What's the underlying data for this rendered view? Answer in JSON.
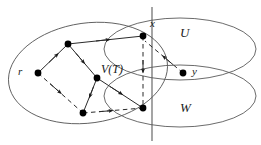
{
  "figure": {
    "type": "graph-diagram",
    "colors": {
      "stroke": "#5a5a5a",
      "edge": "#2b2b2b",
      "vertex_fill": "#000000",
      "text": "#1a1a1a",
      "background": "#ffffff"
    }
  },
  "labels": {
    "root": "r",
    "cut_vertex_top": "x",
    "right_vertex": "y",
    "region_upper": "U",
    "region_lower": "W",
    "tree_set": "V(T)"
  },
  "regions": [
    {
      "name": "vt-ellipse",
      "label": "V(T)",
      "cx": 88,
      "cy": 73,
      "rx": 80,
      "ry": 50,
      "rotate": -8
    },
    {
      "name": "u-ellipse",
      "label": "U",
      "cx": 178,
      "cy": 50,
      "rx": 78,
      "ry": 32,
      "rotate": 0
    },
    {
      "name": "w-ellipse",
      "label": "W",
      "cx": 178,
      "cy": 95,
      "rx": 78,
      "ry": 32,
      "rotate": 0
    }
  ],
  "cut_line": {
    "name": "cut-line",
    "x1": 152,
    "y1": 8,
    "x2": 152,
    "y2": 140
  },
  "vertices": [
    {
      "id": "r",
      "name": "vertex-r",
      "x": 38,
      "y": 73,
      "label": "r"
    },
    {
      "id": "a",
      "name": "vertex-a",
      "x": 68,
      "y": 44,
      "label": ""
    },
    {
      "id": "c",
      "name": "vertex-c",
      "x": 97,
      "y": 78,
      "label": ""
    },
    {
      "id": "d",
      "name": "vertex-d",
      "x": 83,
      "y": 113,
      "label": ""
    },
    {
      "id": "x",
      "name": "vertex-x",
      "x": 143,
      "y": 36,
      "label": "x"
    },
    {
      "id": "w1",
      "name": "vertex-w1",
      "x": 143,
      "y": 108,
      "label": ""
    },
    {
      "id": "y",
      "name": "vertex-y",
      "x": 183,
      "y": 73,
      "label": "y"
    }
  ],
  "edges": [
    {
      "name": "edge-r-a",
      "from": "r",
      "to": "a",
      "style": "solid",
      "arrow": "mid"
    },
    {
      "name": "edge-a-c",
      "from": "a",
      "to": "c",
      "style": "solid",
      "arrow": "mid"
    },
    {
      "name": "edge-a-x",
      "from": "a",
      "to": "x",
      "style": "solid",
      "arrow": "mid"
    },
    {
      "name": "edge-c-d",
      "from": "c",
      "to": "d",
      "style": "solid",
      "arrow": "mid"
    },
    {
      "name": "edge-c-w1",
      "from": "c",
      "to": "w1",
      "style": "solid",
      "arrow": "mid"
    },
    {
      "name": "edge-r-d",
      "from": "r",
      "to": "d",
      "style": "dashed",
      "arrow": "mid"
    },
    {
      "name": "edge-d-w1",
      "from": "d",
      "to": "w1",
      "style": "dashed",
      "arrow": "mid"
    },
    {
      "name": "edge-x-w1",
      "from": "x",
      "to": "w1",
      "style": "dashed",
      "arrow": "mid"
    },
    {
      "name": "edge-y-x",
      "from": "y",
      "to": "x",
      "style": "dashed",
      "arrow": "mid"
    }
  ]
}
